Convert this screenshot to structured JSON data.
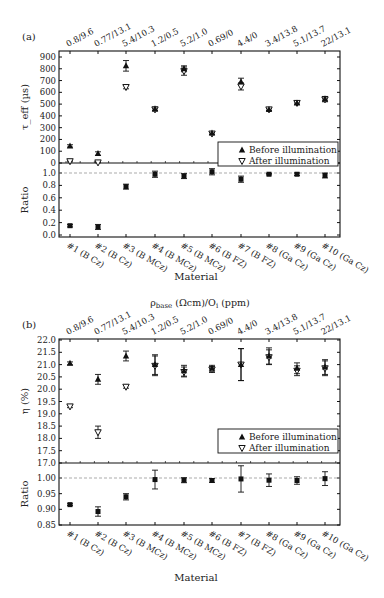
{
  "figure": {
    "panel_a_label": "(a)",
    "panel_b_label": "(b)",
    "top_axis_title": "ρ_base (Ωcm)/O_i (ppm)",
    "top_axis_title_main": "ρ",
    "top_axis_title_sub": "base",
    "top_axis_title_rest": " (Ωcm)/O",
    "top_axis_title_sub2": "i",
    "top_axis_title_end": " (ppm)",
    "xlabel": "Material",
    "legend": {
      "before": "Before illumination",
      "after": "After illumination"
    }
  },
  "chart_data": [
    {
      "type": "scatter",
      "panel": "(a)",
      "title": "",
      "categories": [
        "#1 (B Cz)",
        "#2 (B Cz)",
        "#3 (B MCz)",
        "#4 (B MCz)",
        "#5 (B MCz)",
        "#6 (B FZ)",
        "#7 (B FZ)",
        "#8 (Ga Cz)",
        "#9 (Ga Cz)",
        "#10 (Ga Cz)"
      ],
      "top_tick_labels": [
        "0.8/9.6",
        "0.77/13.1",
        "5.4/10.3",
        "1.2/0.5",
        "5.2/1.0",
        "0.69/0",
        "4.4/0",
        "3.4/13.8",
        "5.1/13.7",
        "22/13.1"
      ],
      "xlabel": "Material",
      "top_xlabel": "ρbase (Ωcm)/Oi (ppm)",
      "upper": {
        "ylabel": "τ_eff (µs)",
        "ylim": [
          0,
          900
        ],
        "yticks": [
          0,
          100,
          200,
          300,
          400,
          500,
          600,
          700,
          800,
          900
        ],
        "series": [
          {
            "name": "Before illumination",
            "marker": "triangle-up-filled",
            "values": [
              145,
              80,
              825,
              460,
              800,
              255,
              690,
              455,
              510,
              545
            ],
            "err": [
              10,
              15,
              45,
              15,
              25,
              10,
              30,
              8,
              10,
              20
            ]
          },
          {
            "name": "After illumination",
            "marker": "triangle-down-open",
            "values": [
              15,
              5,
              645,
              455,
              780,
              250,
              650,
              455,
              510,
              540
            ],
            "err": [
              5,
              3,
              15,
              15,
              35,
              10,
              30,
              8,
              10,
              20
            ]
          }
        ]
      },
      "lower": {
        "ylabel": "Ratio",
        "ylim": [
          0.0,
          1.0
        ],
        "yticks": [
          0.0,
          0.2,
          0.4,
          0.6,
          0.8,
          1.0
        ],
        "reference_line": 1.0,
        "values": [
          0.15,
          0.13,
          0.78,
          0.98,
          0.95,
          1.02,
          0.9,
          0.98,
          0.98,
          0.96
        ],
        "err": [
          0.02,
          0.04,
          0.04,
          0.05,
          0.04,
          0.05,
          0.05,
          0.01,
          0.02,
          0.04
        ]
      },
      "legend_position": "lower right of upper panel",
      "grid": false
    },
    {
      "type": "scatter",
      "panel": "(b)",
      "title": "",
      "categories": [
        "#1 (B Cz)",
        "#2 (B Cz)",
        "#3 (B MCz)",
        "#4 (B MCz)",
        "#5 (B MCz)",
        "#6 (B FZ)",
        "#7 (B FZ)",
        "#8 (Ga Cz)",
        "#9 (Ga Cz)",
        "#10 (Ga Cz)"
      ],
      "top_tick_labels": [
        "0.8/9.6",
        "0.77/13.1",
        "5.4/10.3",
        "1.2/0.5",
        "5.2/1.0",
        "0.69/0",
        "4.4/0",
        "3.4/13.8",
        "5.1/13.7",
        "22/13.1"
      ],
      "xlabel": "Material",
      "upper": {
        "ylabel": "η (%)",
        "ylim": [
          17.0,
          22.0
        ],
        "yticks": [
          17.0,
          17.5,
          18.0,
          18.5,
          19.0,
          19.5,
          20.0,
          20.5,
          21.0,
          21.5,
          22.0
        ],
        "series": [
          {
            "name": "Before illumination",
            "marker": "triangle-up-filled",
            "values": [
              21.05,
              20.4,
              21.35,
              21.0,
              20.75,
              20.85,
              21.0,
              21.35,
              20.85,
              20.9
            ],
            "err": [
              0.06,
              0.2,
              0.2,
              0.4,
              0.22,
              0.12,
              0.65,
              0.33,
              0.22,
              0.3
            ]
          },
          {
            "name": "After illumination",
            "marker": "triangle-down-open",
            "values": [
              19.3,
              18.25,
              20.1,
              20.95,
              20.7,
              20.8,
              21.0,
              21.3,
              20.75,
              20.85
            ],
            "err": [
              0.05,
              0.25,
              0.06,
              0.4,
              0.2,
              0.12,
              0.65,
              0.3,
              0.2,
              0.3
            ]
          }
        ]
      },
      "lower": {
        "ylabel": "Ratio",
        "ylim": [
          0.85,
          1.0
        ],
        "yticks": [
          0.85,
          0.9,
          0.95,
          1.0
        ],
        "reference_line": 1.0,
        "values": [
          0.915,
          0.893,
          0.94,
          0.995,
          0.993,
          0.992,
          0.997,
          0.993,
          0.992,
          0.998
        ],
        "err": [
          0.003,
          0.015,
          0.01,
          0.03,
          0.008,
          0.006,
          0.042,
          0.02,
          0.012,
          0.022
        ]
      },
      "legend_position": "lower right of upper panel",
      "grid": false
    }
  ]
}
